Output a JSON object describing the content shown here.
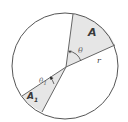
{
  "diagram": {
    "type": "circle-sectors",
    "colors": {
      "stroke": "#555555",
      "sector_fill": "#e6e6e6",
      "background": "#ffffff",
      "label": "#3a3a3a"
    },
    "circle": {
      "cx": 65,
      "cy": 66,
      "r": 53
    },
    "center": {
      "x": 66,
      "y": 67
    },
    "sectors": [
      {
        "id": "A",
        "label": "A",
        "angle_label": "θ",
        "radius_label": "r",
        "edge1_end": {
          "x": 73,
          "y": 14
        },
        "edge2_end": {
          "x": 115,
          "y": 45
        }
      },
      {
        "id": "A1",
        "label": "A",
        "label_sub": "1",
        "angle_label": "θ",
        "angle_sub": "1",
        "edge1_end": {
          "x": 22,
          "y": 96
        },
        "edge2_end": {
          "x": 42,
          "y": 112
        }
      }
    ]
  },
  "labels": {
    "A": "A",
    "theta": "θ",
    "r": "r",
    "theta1_main": "θ",
    "theta1_sub": "1",
    "A1_main": "A",
    "A1_sub": "1"
  }
}
